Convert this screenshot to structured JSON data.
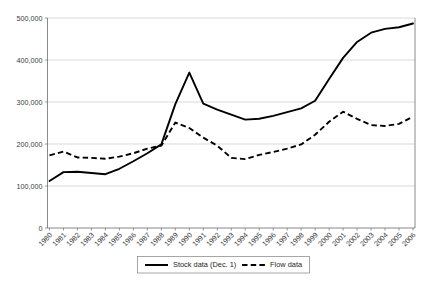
{
  "chart_data": {
    "type": "line",
    "title": "",
    "xlabel": "",
    "ylabel": "",
    "grid": "horizontal",
    "legend_position": "bottom-center",
    "ylim": [
      0,
      500000
    ],
    "ytick_labels": [
      "0",
      "100,000",
      "200,000",
      "300,000",
      "400,000",
      "500,000"
    ],
    "ytick_values": [
      0,
      100000,
      200000,
      300000,
      400000,
      500000
    ],
    "categories": [
      "1980",
      "1981",
      "1982",
      "1983",
      "1984",
      "1985",
      "1986",
      "1987",
      "1988",
      "1989",
      "1990",
      "1991",
      "1992",
      "1993",
      "1994",
      "1995",
      "1996",
      "1997",
      "1998",
      "1999",
      "2000",
      "2001",
      "2002",
      "2003",
      "2004",
      "2005",
      "2006"
    ],
    "series": [
      {
        "name": "Stock data (Dec. 1)",
        "style": "solid",
        "color": "#000000",
        "values": [
          112000,
          133000,
          134000,
          131000,
          128000,
          141000,
          159000,
          178000,
          199000,
          295000,
          370000,
          296000,
          282000,
          270000,
          258000,
          260000,
          267000,
          276000,
          285000,
          303000,
          355000,
          405000,
          443000,
          465000,
          474000,
          478000,
          487000
        ]
      },
      {
        "name": "Flow data",
        "style": "dashed",
        "color": "#000000",
        "values": [
          173000,
          182000,
          168000,
          167000,
          165000,
          170000,
          178000,
          189000,
          196000,
          251000,
          238000,
          215000,
          196000,
          167000,
          164000,
          174000,
          181000,
          189000,
          199000,
          222000,
          253000,
          277000,
          260000,
          245000,
          243000,
          248000,
          265000
        ]
      }
    ]
  },
  "legend": {
    "items": [
      {
        "label": "Stock data (Dec. 1)",
        "style": "solid"
      },
      {
        "label": "Flow data",
        "style": "dashed"
      }
    ]
  }
}
